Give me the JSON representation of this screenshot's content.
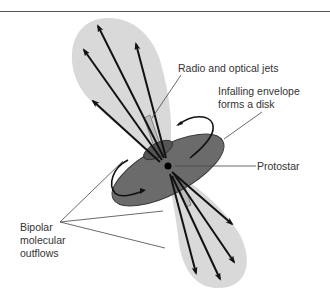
{
  "diagram": {
    "labels": {
      "jets": "Radio and optical jets",
      "envelope_line1": "Infalling envelope",
      "envelope_line2": "forms a disk",
      "protostar": "Protostar",
      "outflows_line1": "Bipolar",
      "outflows_line2": "molecular",
      "outflows_line3": "outflows"
    },
    "colors": {
      "lobe": "#d9d9d9",
      "disk": "#6b6b6b",
      "disk_edge": "#3a3a3a",
      "jet": "#bdbdbd",
      "arrow": "#111111",
      "leader": "#444444"
    }
  }
}
